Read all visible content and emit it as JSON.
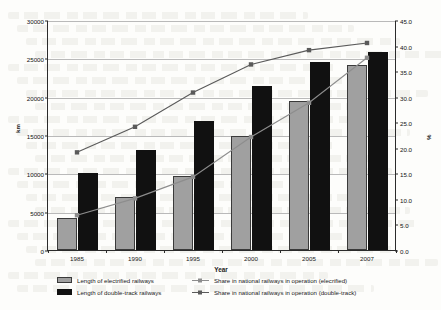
{
  "chart_data": {
    "type": "bar",
    "title": "",
    "subtitle": "",
    "categories": [
      "1985",
      "1990",
      "1995",
      "2000",
      "2005",
      "2007"
    ],
    "xlabel": "Year",
    "ylabel": "km",
    "ylabel_secondary": "%",
    "ylim": [
      0,
      30000
    ],
    "ylim_secondary": [
      0,
      45
    ],
    "yticks": [
      "0",
      "5000",
      "10000",
      "15000",
      "20000",
      "25000",
      "30000"
    ],
    "ytick_values": [
      0,
      5000,
      10000,
      15000,
      20000,
      25000,
      30000
    ],
    "yticks_secondary": [
      "0.0",
      "5.0",
      "10.0",
      "15.0",
      "20.0",
      "25.0",
      "30.0",
      "35.0",
      "40.0",
      "45.0"
    ],
    "ytick_values_secondary": [
      0,
      5,
      10,
      15,
      20,
      25,
      30,
      35,
      40,
      45
    ],
    "grid": true,
    "legend_position": "bottom",
    "series": [
      {
        "name": "Length of electrified railways",
        "type": "bar",
        "axis": "left",
        "color": "#a0a0a0",
        "values": [
          4200,
          6900,
          9700,
          14900,
          19400,
          24100
        ]
      },
      {
        "name": "Length of double-track railways",
        "type": "bar",
        "axis": "left",
        "color": "#111111",
        "values": [
          10000,
          13000,
          16800,
          21400,
          24500,
          25800
        ]
      },
      {
        "name": "Share in national railways in operation (elecrified)",
        "type": "line",
        "axis": "right",
        "color": "#8d8d8d",
        "marker": "square",
        "values": [
          7.0,
          10.3,
          14.5,
          22.3,
          29.0,
          37.8
        ]
      },
      {
        "name": "Share in national railways in operation (double-track)",
        "type": "line",
        "axis": "right",
        "color": "#5a5a5a",
        "marker": "square",
        "values": [
          19.3,
          24.3,
          31.0,
          36.5,
          39.3,
          40.7
        ]
      }
    ]
  },
  "legend": {
    "items": [
      {
        "label": "Length of electrified railways",
        "style": "swatch-gray"
      },
      {
        "label": "Share in national railways in operation (elecrified)",
        "style": "line-light"
      },
      {
        "label": "Length of double-track railways",
        "style": "swatch-black"
      },
      {
        "label": "Share in national railways in operation (double-track)",
        "style": "line-dark"
      }
    ]
  }
}
